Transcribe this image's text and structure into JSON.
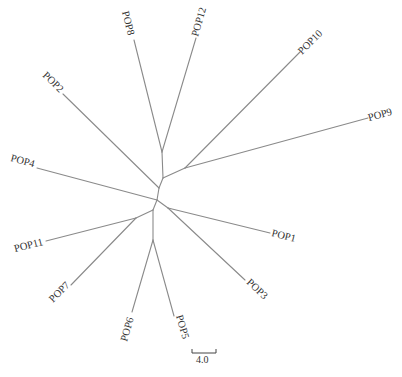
{
  "tree": {
    "type": "unrooted-phylogenetic-tree",
    "colors": {
      "branch": "#8a8a8a",
      "text": "#333333",
      "background": "#ffffff"
    },
    "leaves": [
      {
        "id": "POP1",
        "label": "POP1"
      },
      {
        "id": "POP2",
        "label": "POP2"
      },
      {
        "id": "POP3",
        "label": "POP3"
      },
      {
        "id": "POP4",
        "label": "POP4"
      },
      {
        "id": "POP5",
        "label": "POP5"
      },
      {
        "id": "POP6",
        "label": "POP6"
      },
      {
        "id": "POP7",
        "label": "POP7"
      },
      {
        "id": "POP8",
        "label": "POP8"
      },
      {
        "id": "POP9",
        "label": "POP9"
      },
      {
        "id": "POP10",
        "label": "POP10"
      },
      {
        "id": "POP11",
        "label": "POP11"
      },
      {
        "id": "POP12",
        "label": "POP12"
      }
    ],
    "scale_bar": {
      "label": "4.0"
    }
  }
}
